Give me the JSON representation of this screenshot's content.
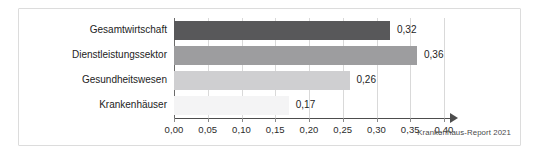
{
  "caption": "Krankenhaus-Report 2021",
  "chart_data": {
    "type": "bar",
    "orientation": "horizontal",
    "title": "",
    "subtitle": "",
    "xlabel": "",
    "ylabel": "",
    "xlim": [
      0.0,
      0.4
    ],
    "xtick_step": 0.05,
    "grid": true,
    "legend": false,
    "decimal_separator": ",",
    "categories": [
      "Gesamtwirtschaft",
      "Dienstleistungssektor",
      "Gesundheitswesen",
      "Krankenhäuser"
    ],
    "values": [
      0.32,
      0.36,
      0.26,
      0.17
    ],
    "value_labels": [
      "0,32",
      "0,36",
      "0,26",
      "0,17"
    ],
    "bar_colors": [
      "#58585a",
      "#9d9d9f",
      "#cfcfd1",
      "#f4f4f5"
    ],
    "tick_labels": [
      "0,00",
      "0,05",
      "0,10",
      "0,15",
      "0,20",
      "0,25",
      "0,30",
      "0,35",
      "0,40"
    ],
    "tick_values": [
      0.0,
      0.05,
      0.1,
      0.15,
      0.2,
      0.25,
      0.3,
      0.35,
      0.4
    ]
  }
}
